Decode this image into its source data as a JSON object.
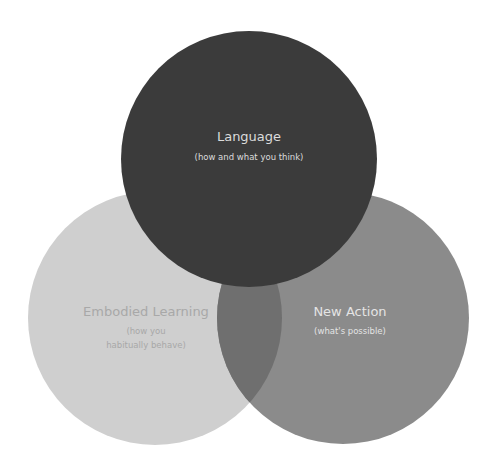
{
  "diagram": {
    "type": "venn",
    "circles": [
      {
        "id": "language",
        "title": "Language",
        "subtitle_lines": [
          "(how and what you think)"
        ],
        "fill": "#3b3b3b",
        "text_color": "#dcdcdc"
      },
      {
        "id": "embodied-learning",
        "title": "Embodied Learning",
        "subtitle_lines": [
          "(how you",
          "habitually behave)"
        ],
        "fill": "#cfcfcf",
        "text_color": "#a8a8a8"
      },
      {
        "id": "new-action",
        "title": "New Action",
        "subtitle_lines": [
          "(what's possible)"
        ],
        "fill": "#8b8b8b",
        "text_color": "#e4e4e4"
      }
    ],
    "overlaps": {
      "embodied-new-action": "#6f6f6f"
    }
  }
}
